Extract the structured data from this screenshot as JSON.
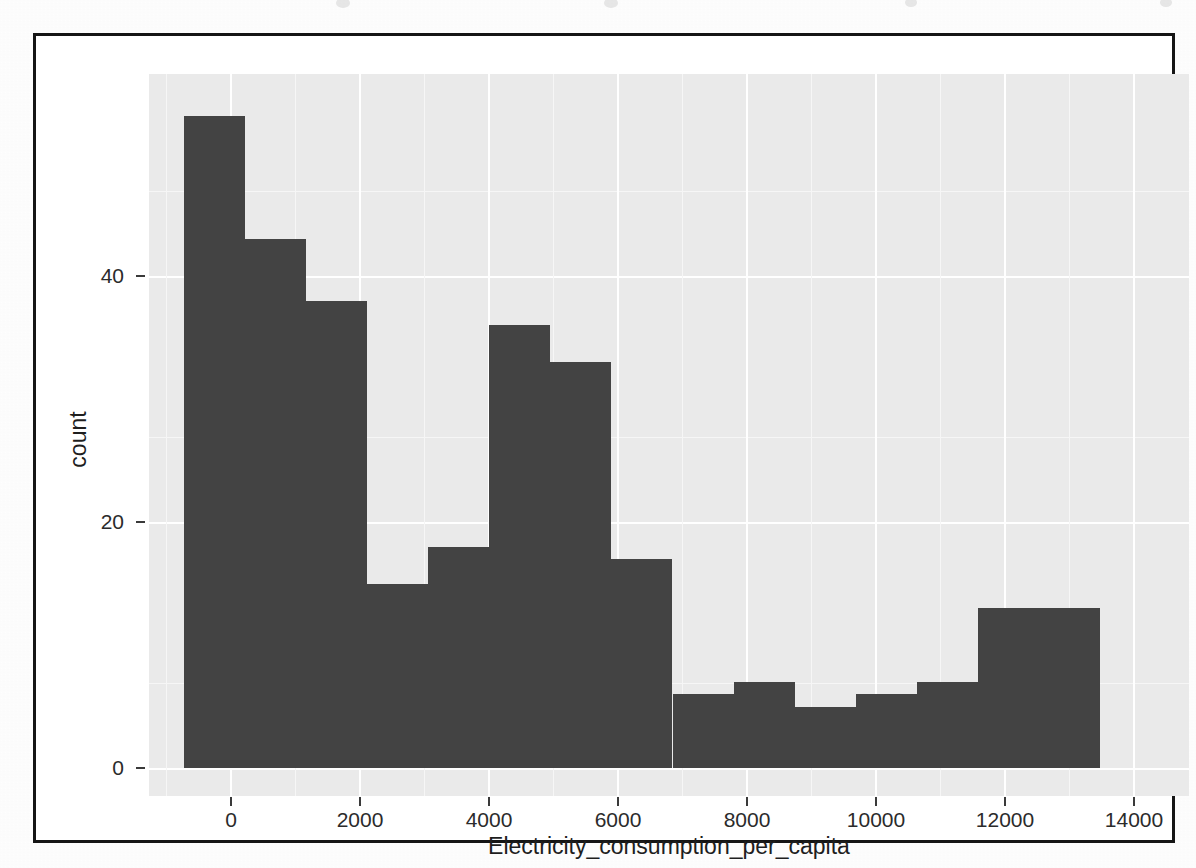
{
  "figure": {
    "kind": "histogram",
    "border_color": "#151515",
    "panel_bg": "#eaeaea",
    "gridline_color": "#ffffff",
    "bar_color": "#434343"
  },
  "axes": {
    "x": {
      "title": "Electricity_consumption_per_capita",
      "ticks": [
        "0",
        "2000",
        "4000",
        "6000",
        "8000",
        "10000",
        "12000",
        "14000"
      ],
      "tick_values": [
        0,
        2000,
        4000,
        6000,
        8000,
        10000,
        12000,
        14000
      ],
      "range": [
        -1050,
        15300
      ]
    },
    "y": {
      "title": "count",
      "ticks": [
        "0",
        "20",
        "40"
      ],
      "tick_values": [
        0,
        20,
        40
      ],
      "range": [
        0,
        58.5
      ]
    }
  },
  "chart_data": {
    "type": "bar",
    "title": "",
    "subtitle": "",
    "xlabel": "Electricity_consumption_per_capita",
    "ylabel": "count",
    "xlim": [
      -1050,
      15300
    ],
    "ylim": [
      0,
      58.5
    ],
    "grid": true,
    "legend": "none",
    "bin_width": 960,
    "categories": [
      "-500 to 460",
      "460 to 1420",
      "1420 to 2380",
      "2380 to 3340",
      "3340 to 4300",
      "4300 to 5260",
      "5260 to 6220",
      "6220 to 7180",
      "7180 to 8140",
      "8140 to 9100",
      "9100 to 10060",
      "10060 to 11020",
      "11020 to 11980",
      "11980 to 12940",
      "12940 to 13900"
    ],
    "bin_starts": [
      -500,
      460,
      1420,
      2380,
      3340,
      4300,
      5260,
      6220,
      7180,
      8140,
      9100,
      10060,
      11020,
      11980,
      12940
    ],
    "values": [
      53,
      43,
      38,
      15,
      18,
      36,
      33,
      17,
      6,
      7,
      5,
      6,
      7,
      13,
      0
    ],
    "bars": [
      {
        "x0": -500,
        "x1": 460,
        "count": 53
      },
      {
        "x0": 460,
        "x1": 1420,
        "count": 43
      },
      {
        "x0": 1420,
        "x1": 2380,
        "count": 38
      },
      {
        "x0": 2380,
        "x1": 3340,
        "count": 15
      },
      {
        "x0": 3340,
        "x1": 4300,
        "count": 18
      },
      {
        "x0": 4300,
        "x1": 5260,
        "count": 36
      },
      {
        "x0": 5260,
        "x1": 6220,
        "count": 33
      },
      {
        "x0": 6220,
        "x1": 7180,
        "count": 17
      },
      {
        "x0": 7180,
        "x1": 8140,
        "count": 6
      },
      {
        "x0": 8140,
        "x1": 9100,
        "count": 7
      },
      {
        "x0": 9100,
        "x1": 10060,
        "count": 5
      },
      {
        "x0": 10060,
        "x1": 11020,
        "count": 6
      },
      {
        "x0": 11020,
        "x1": 11980,
        "count": 7
      },
      {
        "x0": 11980,
        "x1": 13900,
        "count": 13
      }
    ]
  }
}
